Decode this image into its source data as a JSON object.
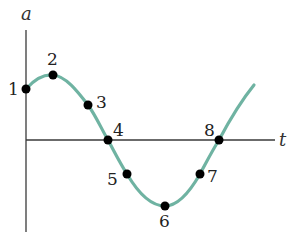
{
  "axes": {
    "y_label": "a",
    "x_label": "t"
  },
  "curve": {
    "shape": "sinusoid",
    "color": "#6fb3a2"
  },
  "points": [
    {
      "label": "1",
      "x": 26,
      "y": 89
    },
    {
      "label": "2",
      "x": 53,
      "y": 75
    },
    {
      "label": "3",
      "x": 88,
      "y": 105
    },
    {
      "label": "4",
      "x": 108,
      "y": 140
    },
    {
      "label": "5",
      "x": 127,
      "y": 174
    },
    {
      "label": "6",
      "x": 165,
      "y": 206
    },
    {
      "label": "7",
      "x": 200,
      "y": 174
    },
    {
      "label": "8",
      "x": 219,
      "y": 140
    }
  ]
}
